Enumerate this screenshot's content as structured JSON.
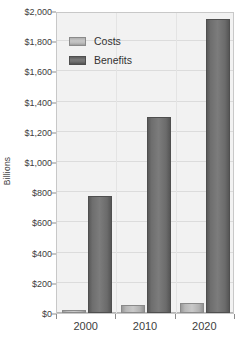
{
  "chart_data": {
    "type": "bar",
    "title": "",
    "subtitle": "",
    "xlabel": "",
    "ylabel": "Billions",
    "categories": [
      "2000",
      "2010",
      "2020"
    ],
    "series": [
      {
        "name": "Costs",
        "values": [
          20,
          55,
          65
        ]
      },
      {
        "name": "Benefits",
        "values": [
          775,
          1300,
          1950
        ]
      }
    ],
    "ylim": [
      0,
      2000
    ],
    "ytick_values": [
      0,
      200,
      400,
      600,
      800,
      1000,
      1200,
      1400,
      1600,
      1800,
      2000
    ],
    "ytick_labels": [
      "$0",
      "$200",
      "$400",
      "$600",
      "$800",
      "$1,000",
      "$1,200",
      "$1,400",
      "$1,600",
      "$1,800",
      "$2,000"
    ],
    "grid": true,
    "legend_position": "top-left",
    "legend_entries": [
      "Costs",
      "Benefits"
    ],
    "colors": {
      "costs": "#bdbdbd",
      "benefits": "#6e6e6e",
      "plot_background": "#f2f2f2",
      "plot_border": "#c8c8c8",
      "gridline": "#dcdcdc",
      "text": "#3d3d3d"
    }
  }
}
